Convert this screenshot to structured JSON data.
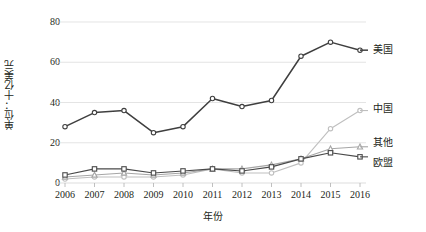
{
  "chart_data": {
    "type": "line",
    "title": "",
    "xlabel": "年份",
    "ylabel": "单位：十亿美元",
    "x": [
      2006,
      2007,
      2008,
      2009,
      2010,
      2011,
      2012,
      2013,
      2014,
      2015,
      2016
    ],
    "categories": [
      "2006",
      "2007",
      "2008",
      "2009",
      "2010",
      "2011",
      "2012",
      "2013",
      "2014",
      "2015",
      "2016"
    ],
    "ylim": [
      0,
      80
    ],
    "yticks": [
      0,
      20,
      40,
      60,
      80
    ],
    "grid": true,
    "legend_position": "right-of-plot",
    "series": [
      {
        "name": "美国",
        "color": "#3f3f3f",
        "marker": "circle",
        "values": [
          28,
          35,
          36,
          25,
          28,
          42,
          38,
          41,
          63,
          70,
          66
        ]
      },
      {
        "name": "中国",
        "color": "#bfbfbf",
        "marker": "circle",
        "values": [
          2,
          3,
          3,
          3,
          4,
          7,
          5,
          5,
          10,
          27,
          36
        ]
      },
      {
        "name": "其他",
        "color": "#a6a6a6",
        "marker": "triangle",
        "values": [
          3,
          4,
          5,
          4,
          5,
          7,
          7,
          9,
          12,
          17,
          18
        ]
      },
      {
        "name": "欧盟",
        "color": "#4a4a4a",
        "marker": "square",
        "values": [
          4,
          7,
          7,
          5,
          6,
          7,
          6,
          8,
          12,
          15,
          13
        ]
      }
    ]
  },
  "axis": {
    "y_title": "单位：十亿美元",
    "x_title": "年份",
    "ytick_labels": [
      "0",
      "20",
      "40",
      "60",
      "80"
    ],
    "xtick_labels": [
      "2006",
      "2007",
      "2008",
      "2009",
      "2010",
      "2011",
      "2012",
      "2013",
      "2014",
      "2015",
      "2016"
    ]
  },
  "legend": {
    "items": [
      {
        "label": "美国"
      },
      {
        "label": "中国"
      },
      {
        "label": "其他"
      },
      {
        "label": "欧盟"
      }
    ]
  }
}
